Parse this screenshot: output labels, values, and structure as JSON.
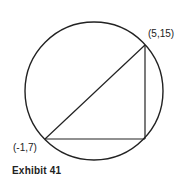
{
  "diagram": {
    "type": "circle-inscribed-right-triangle",
    "caption": "Exhibit 41",
    "points": {
      "top_right": {
        "label": "(5,15)",
        "x": 5,
        "y": 15
      },
      "bottom_left": {
        "label": "(-1,7)",
        "x": -1,
        "y": 7
      }
    },
    "stroke_color": "#222222",
    "background": "#ffffff"
  }
}
